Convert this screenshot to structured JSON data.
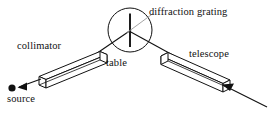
{
  "figure": {
    "background_color": "#ffffff",
    "stroke_color": "#111111",
    "width": 274,
    "height": 114
  },
  "labels": {
    "collimator": "collimator",
    "table": "table",
    "source": "source",
    "diffraction_grating": "diffraction grating",
    "telescope": "telescope"
  },
  "parts": {
    "source_point": {
      "name": "source-point",
      "cx": 12,
      "cy": 88,
      "r": 3.4
    },
    "incoming_ray": {
      "name": "incoming-ray",
      "x1": 36,
      "y1": 80,
      "x2": 18,
      "y2": 87,
      "arrow": "left-down"
    },
    "collimator_tube": {
      "name": "collimator-tube",
      "axis": {
        "x1": 30,
        "y1": 83,
        "x2": 104,
        "y2": 54
      },
      "width": 9
    },
    "table_circle": {
      "name": "table-circle",
      "cx": 130,
      "cy": 30,
      "r": 22
    },
    "grating_line": {
      "name": "grating-line",
      "x1": 130,
      "y1": 14,
      "x2": 130,
      "y2": 47
    },
    "grating_leader": {
      "name": "grating-leader-line",
      "x1": 127,
      "y1": 32,
      "x2": 153,
      "y2": 14
    },
    "beam_in": {
      "name": "beam-to-table",
      "x1": 86,
      "y1": 61,
      "x2": 130,
      "y2": 31
    },
    "beam_out": {
      "name": "beam-from-table",
      "x1": 130,
      "y1": 31,
      "x2": 178,
      "y2": 58
    },
    "telescope_tube": {
      "name": "telescope-tube",
      "axis": {
        "x1": 166,
        "y1": 54,
        "x2": 232,
        "y2": 84
      },
      "width": 9
    },
    "exit_ray": {
      "name": "exit-ray",
      "x1": 225,
      "y1": 83,
      "x2": 266,
      "y2": 106,
      "arrow": "right-down"
    }
  }
}
